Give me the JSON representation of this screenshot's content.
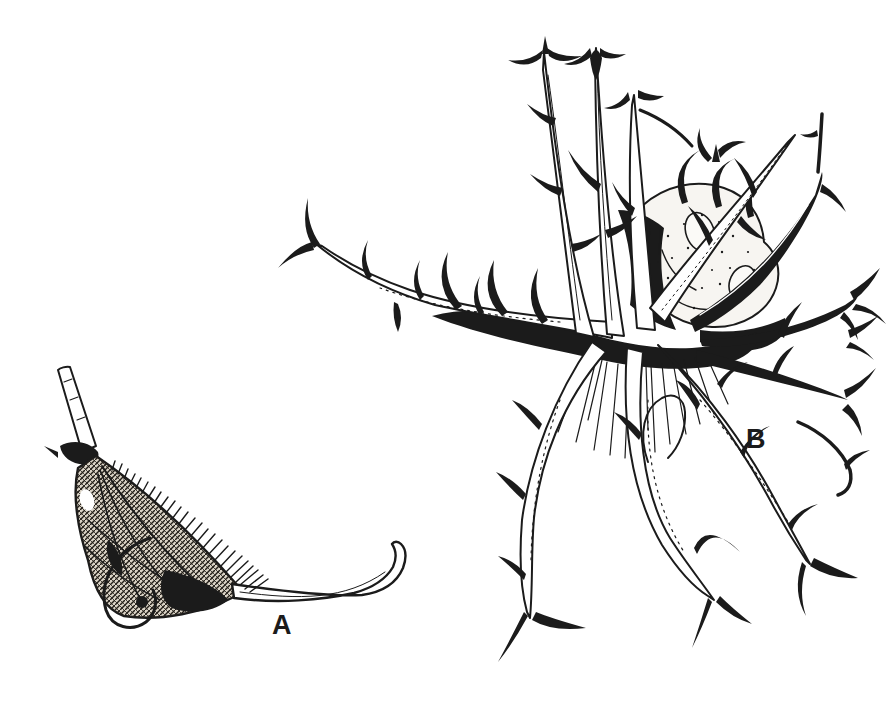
{
  "page": {
    "background_color": "#ffffff",
    "ink_color": "#1b1b1b"
  },
  "figure": {
    "part_a": {
      "label": "A"
    },
    "part_b": {
      "label": "B"
    }
  }
}
